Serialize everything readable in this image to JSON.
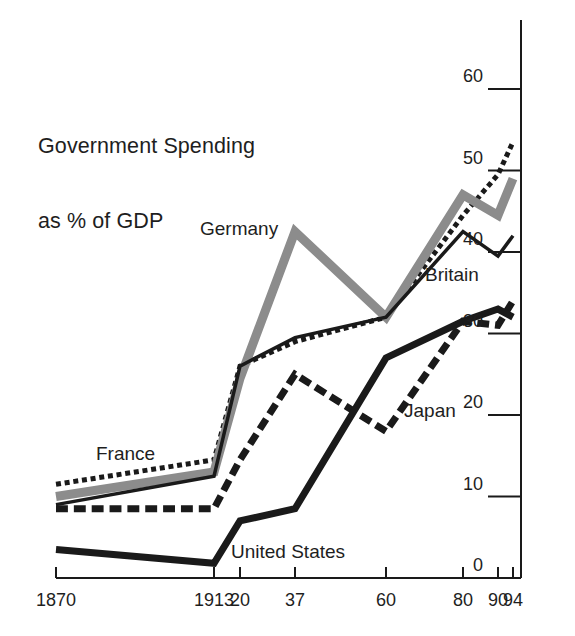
{
  "chart_data": {
    "type": "line",
    "title": "Government Spending\nas % of GDP",
    "title_line1": "Government Spending",
    "title_line2": "as % of GDP",
    "xlabel": "",
    "ylabel": "",
    "x": [
      "1870",
      "1913",
      "20",
      "37",
      "60",
      "80",
      "90",
      "94"
    ],
    "categories": [
      "1870",
      "1913",
      "20",
      "37",
      "60",
      "80",
      "90",
      "94"
    ],
    "xtick_labels": [
      "1870",
      "1913",
      "20",
      "37",
      "60",
      "80",
      "90",
      "94"
    ],
    "ytick_labels": [
      "0",
      "10",
      "20",
      "30",
      "40",
      "50",
      "60"
    ],
    "ytick_values": [
      0,
      10,
      20,
      30,
      40,
      50,
      60
    ],
    "ylim": [
      0,
      63
    ],
    "grid": false,
    "legend_position": "inline-annotations",
    "axis_style": "y-axis on right, x-axis at bottom",
    "series": [
      {
        "name": "France",
        "values": [
          11.5,
          14.5,
          26.0,
          29.0,
          32.0,
          44.5,
          49.5,
          53.5
        ],
        "style": "dotted",
        "color": "#1a1a1a",
        "width": 5,
        "label_x": 96,
        "label_y": 443
      },
      {
        "name": "Germany",
        "values": [
          10.0,
          13.0,
          24.5,
          42.5,
          32.0,
          47.0,
          44.5,
          49.0
        ],
        "style": "solid",
        "color": "#8c8c8c",
        "width": 9,
        "label_x": 200,
        "label_y": 218
      },
      {
        "name": "Britain",
        "values": [
          9.0,
          12.5,
          26.0,
          29.5,
          32.0,
          42.5,
          39.5,
          42.0
        ],
        "style": "solid",
        "color": "#1a1a1a",
        "width": 3.5,
        "label_x": 425,
        "label_y": 264
      },
      {
        "name": "Japan",
        "values": [
          8.5,
          8.5,
          14.5,
          25.0,
          18.0,
          31.5,
          31.0,
          34.0
        ],
        "style": "dashed",
        "color": "#1a1a1a",
        "width": 7,
        "label_x": 404,
        "label_y": 400
      },
      {
        "name": "United States",
        "values": [
          3.5,
          1.8,
          7.0,
          8.5,
          27.0,
          31.5,
          33.0,
          32.0
        ],
        "style": "solid",
        "color": "#1a1a1a",
        "width": 7,
        "label_x": 231,
        "label_y": 541
      }
    ],
    "annotations": [
      {
        "text": "France",
        "series": "France"
      },
      {
        "text": "Germany",
        "series": "Germany"
      },
      {
        "text": "Britain",
        "series": "Britain"
      },
      {
        "text": "Japan",
        "series": "Japan"
      },
      {
        "text": "United States",
        "series": "United States"
      }
    ]
  },
  "colors": {
    "background": "#ffffff",
    "ink": "#1a1a1a",
    "germany_gray": "#8c8c8c",
    "axis": "#1a1a1a"
  }
}
